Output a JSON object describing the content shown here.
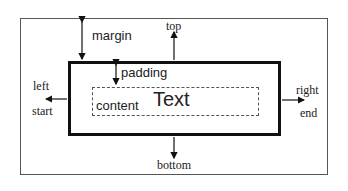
{
  "diagram": {
    "type": "css-box-model",
    "labels": {
      "margin": "margin",
      "padding": "padding",
      "content": "content",
      "text": "Text",
      "top": "top",
      "bottom": "bottom",
      "left": "left",
      "start": "start",
      "right": "right",
      "end": "end"
    },
    "colors": {
      "border": "#111111",
      "frame": "#555555",
      "text": "#222222"
    }
  }
}
